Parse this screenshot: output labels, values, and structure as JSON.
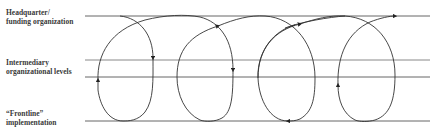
{
  "diagram": {
    "type": "process-loop-diagram",
    "levels": [
      {
        "id": "headquarter",
        "lines": [
          "Headquarter/",
          "funding organization"
        ],
        "line_y": [
          16
        ]
      },
      {
        "id": "intermediary",
        "lines": [
          "Intermediary",
          "organizational levels"
        ],
        "line_y": [
          60,
          77
        ]
      },
      {
        "id": "frontline",
        "lines": [
          "“Frontline”",
          "implementation"
        ],
        "line_y": [
          121
        ]
      }
    ],
    "loops_count": 4,
    "line_color": "#555555",
    "curve_color": "#333333",
    "arrow_directions": [
      "down",
      "up",
      "down",
      "up-right",
      "left",
      "up-right",
      "up",
      "right"
    ]
  }
}
